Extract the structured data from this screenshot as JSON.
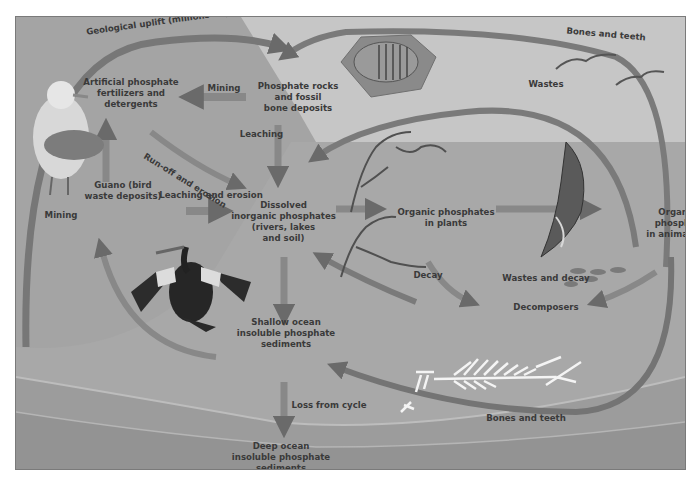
{
  "colors": {
    "frame_bg": "#a4a4a4",
    "sky_light": "#c9c9c9",
    "ocean": "#a9a9a9",
    "sediment": "#9a9a9a",
    "arrow": "#6e6e6e",
    "text": "#3a3a3a"
  },
  "labels": {
    "geological_uplift": "Geological uplift (millions of years)",
    "bones_and_teeth_top": "Bones and teeth",
    "artificial_fertilizers": "Artificial phosphate\nfertilizers and\ndetergents",
    "mining_top": "Mining",
    "phosphate_rocks": "Phosphate rocks\nand fossil\nbone deposits",
    "wastes": "Wastes",
    "leaching": "Leaching",
    "runoff_erosion": "Run-off and erosion",
    "guano": "Guano (bird\nwaste deposits)",
    "leaching_and_erosion": "Leaching and erosion",
    "mining_left": "Mining",
    "dissolved_phosphates": "Dissolved\ninorganic phosphates\n(rivers, lakes\nand soil)",
    "organic_plants": "Organic phosphates\nin plants",
    "organic_animals": "Organic phospha\nin animals",
    "decay": "Decay",
    "wastes_and_decay": "Wastes and decay",
    "decomposers": "Decomposers",
    "shallow_ocean": "Shallow ocean\ninsoluble phosphate\nsediments",
    "loss_from_cycle": "Loss from cycle",
    "bones_and_teeth_bottom": "Bones and teeth",
    "deep_ocean": "Deep ocean\ninsoluble phosphate sediments"
  },
  "illustrations": {
    "gull": "seagull-illustration",
    "cormorant": "cormorant-illustration",
    "trilobite": "trilobite-fossil-illustration",
    "birds": "flying-birds-illustration",
    "seaweed": "seaweed-illustration",
    "shark": "shark-illustration",
    "small_fish": "small-fish-illustration",
    "fish_skeleton": "fish-skeleton-illustration"
  }
}
